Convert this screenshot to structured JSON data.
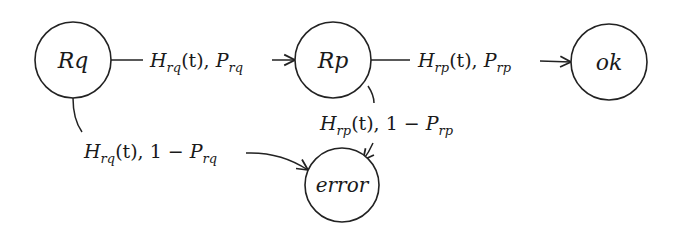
{
  "diagram": {
    "type": "state-transition",
    "nodes": [
      {
        "id": "Rq",
        "label": "Rq"
      },
      {
        "id": "Rp",
        "label": "Rp"
      },
      {
        "id": "ok",
        "label": "ok"
      },
      {
        "id": "error",
        "label": "error"
      }
    ],
    "edges": [
      {
        "from": "Rq",
        "to": "Rp",
        "label": {
          "H": "H",
          "h_sub": "rq",
          "t": "(t), ",
          "prefix": "",
          "P": "P",
          "p_sub": "rq"
        },
        "text": "H_rq(t), P_rq"
      },
      {
        "from": "Rp",
        "to": "ok",
        "label": {
          "H": "H",
          "h_sub": "rp",
          "t": "(t), ",
          "prefix": "",
          "P": "P",
          "p_sub": "rp"
        },
        "text": "H_rp(t), P_rp"
      },
      {
        "from": "Rq",
        "to": "error",
        "label": {
          "H": "H",
          "h_sub": "rq",
          "t": "(t), ",
          "prefix": "1 − ",
          "P": "P",
          "p_sub": "rq"
        },
        "text": "H_rq(t), 1 − P_rq"
      },
      {
        "from": "Rp",
        "to": "error",
        "label": {
          "H": "H",
          "h_sub": "rp",
          "t": "(t), ",
          "prefix": "1 − ",
          "P": "P",
          "p_sub": "rp"
        },
        "text": "H_rp(t), 1 − P_rp"
      }
    ]
  }
}
